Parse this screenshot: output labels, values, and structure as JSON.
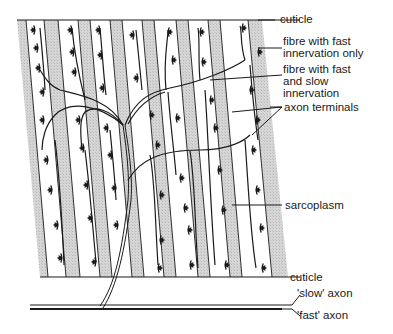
{
  "diagram": {
    "colors": {
      "ink": "#1a1a1a",
      "fibre_shade": "#cfcfcf",
      "background": "#ffffff"
    },
    "labels": {
      "cuticle_top": "cuticle",
      "fibre_fast_only": "fibre with fast\ninnervation only",
      "fibre_fast_slow": "fibre with fast\nand slow\ninnervation",
      "axon_terminals": "axon terminals",
      "sarcoplasm": "sarcoplasm",
      "cuticle_bottom": "cuticle",
      "slow_axon": "'slow' axon",
      "fast_axon": "'fast' axon"
    },
    "stripe_count": 12
  }
}
